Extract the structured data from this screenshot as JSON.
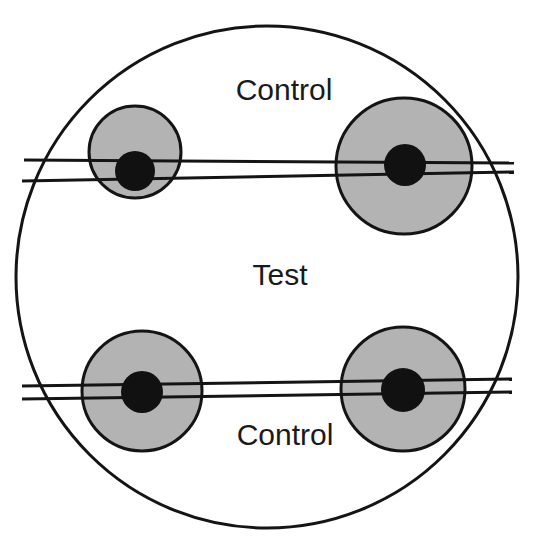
{
  "figure": {
    "canvas": {
      "width": 537,
      "height": 554
    },
    "background_color": "#ffffff",
    "outline_color": "#141414",
    "gray_fill_color": "#b3b3b3",
    "dot_fill_color": "#111111",
    "outer_circle": {
      "cx": 267,
      "cy": 277,
      "r": 251,
      "stroke_width": 3
    },
    "labels": [
      {
        "id": "label-control-top",
        "text": "Control",
        "x": 284,
        "y": 100
      },
      {
        "id": "label-test-middle",
        "text": "Test",
        "x": 280,
        "y": 285
      },
      {
        "id": "label-control-bottom",
        "text": "Control",
        "x": 285,
        "y": 445
      }
    ],
    "zones": [
      {
        "id": "zone-top-left",
        "position": "top-left",
        "halo": {
          "cx": 135,
          "cy": 152,
          "r": 46
        },
        "dot": {
          "cx": 135,
          "cy": 171,
          "r": 20
        }
      },
      {
        "id": "zone-top-right",
        "position": "top-right",
        "halo": {
          "cx": 404,
          "cy": 166,
          "r": 68
        },
        "dot": {
          "cx": 405,
          "cy": 165,
          "r": 21
        }
      },
      {
        "id": "zone-bottom-left",
        "position": "bottom-left",
        "halo": {
          "cx": 142,
          "cy": 391,
          "r": 60
        },
        "dot": {
          "cx": 142,
          "cy": 392,
          "r": 21
        }
      },
      {
        "id": "zone-bottom-right",
        "position": "bottom-right",
        "halo": {
          "cx": 403,
          "cy": 389,
          "r": 62
        },
        "dot": {
          "cx": 403,
          "cy": 390,
          "r": 22
        }
      }
    ],
    "divider_bands": [
      {
        "id": "divider-top",
        "upper_line": {
          "x1": 24,
          "y1": 160,
          "x2": 514,
          "y2": 163
        },
        "lower_line": {
          "x1": 22,
          "y1": 181,
          "x2": 514,
          "y2": 172
        }
      },
      {
        "id": "divider-bottom",
        "upper_line": {
          "x1": 22,
          "y1": 386,
          "x2": 512,
          "y2": 379
        },
        "lower_line": {
          "x1": 22,
          "y1": 399,
          "x2": 512,
          "y2": 392
        }
      }
    ],
    "line_stroke_width": 3
  }
}
